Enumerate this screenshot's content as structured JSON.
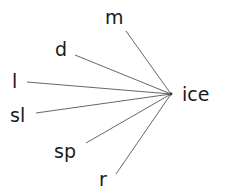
{
  "diagram": {
    "type": "word-family-fan",
    "center": {
      "label": "ice"
    },
    "branches": [
      {
        "label": "m"
      },
      {
        "label": "d"
      },
      {
        "label": "l"
      },
      {
        "label": "sl"
      },
      {
        "label": "sp"
      },
      {
        "label": "r"
      }
    ],
    "colors": {
      "text": "#1a1a1a",
      "line": "#555555"
    }
  }
}
